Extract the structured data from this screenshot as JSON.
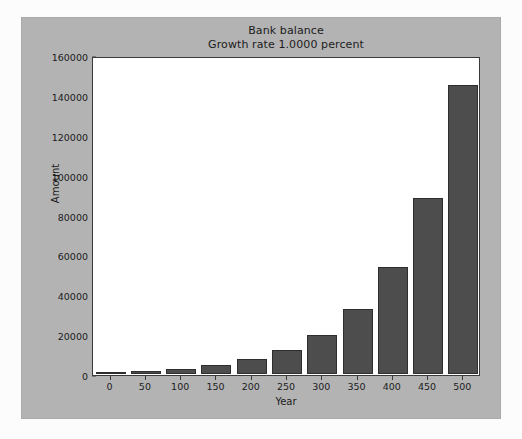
{
  "chart_data": {
    "type": "bar",
    "title": "Bank balance",
    "subtitle": "Growth rate 1.0000 percent",
    "xlabel": "Year",
    "ylabel": "Amount",
    "categories": [
      "0",
      "50",
      "100",
      "150",
      "200",
      "250",
      "300",
      "350",
      "400",
      "450",
      "500"
    ],
    "values": [
      1000,
      1645,
      2705,
      4448,
      7316,
      12033,
      19789,
      32545,
      53528,
      88033,
      144773
    ],
    "xtick_labels": [
      "0",
      "50",
      "100",
      "150",
      "200",
      "250",
      "300",
      "350",
      "400",
      "450",
      "500"
    ],
    "ytick_labels": [
      "0",
      "20000",
      "40000",
      "60000",
      "80000",
      "100000",
      "120000",
      "140000",
      "160000"
    ],
    "ytick_values": [
      0,
      20000,
      40000,
      60000,
      80000,
      100000,
      120000,
      140000,
      160000
    ],
    "ylim": [
      0,
      160000
    ],
    "xlim": [
      -25,
      525
    ],
    "grid": false,
    "legend": null,
    "bar_color": "#4d4d4d",
    "bar_edge_color": "#2e2e2e",
    "plot_background": "#ffffff",
    "figure_background": "#b3b3b3",
    "axis_color": "#3a3a3a",
    "text_color": "#1c1c1c"
  }
}
